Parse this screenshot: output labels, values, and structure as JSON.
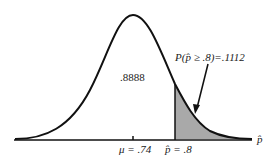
{
  "diagram": {
    "type": "normal-distribution",
    "center_area_label": ".8888",
    "tail_prob_label": "P(p̂ ≥ .8)=.1112",
    "mean_label": "μ = .74",
    "cutoff_label": "p̂ = .8",
    "axis_label": "p̂",
    "shade_color": "#a9a9a9",
    "line_color": "#111111"
  }
}
